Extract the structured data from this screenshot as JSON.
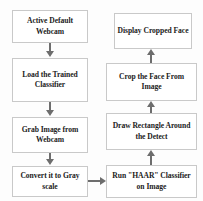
{
  "diagram": {
    "type": "flowchart",
    "orientation": "two-column-serpentine",
    "colors": {
      "box_fill": "#ffffff",
      "box_border": "#c9c9c9",
      "text": "#1b1b1b",
      "connector": "#6d6d6d",
      "background": "#fdfdfd"
    },
    "nodes": [
      {
        "id": "active-webcam",
        "label": "Active Default Webcam",
        "column": "left",
        "order": 1
      },
      {
        "id": "load-classifier",
        "label": "Load the Trained Classifier",
        "column": "left",
        "order": 2
      },
      {
        "id": "grab-image",
        "label": "Grab Image from Webcam",
        "column": "left",
        "order": 3
      },
      {
        "id": "convert-gray",
        "label": "Convert it to Gray scale",
        "column": "left",
        "order": 4
      },
      {
        "id": "run-haar",
        "label": "Run \"HAAR\" Classifier on Image",
        "column": "right",
        "order": 5
      },
      {
        "id": "draw-rect",
        "label": "Draw Rectangle Around the Detect",
        "column": "right",
        "order": 6
      },
      {
        "id": "crop-face",
        "label": "Crop the Face From Image",
        "column": "right",
        "order": 7
      },
      {
        "id": "display-face",
        "label": "Display Cropped Face",
        "column": "right",
        "order": 8
      }
    ],
    "connectors": [
      {
        "id": "c1",
        "from": "active-webcam",
        "to": "load-classifier",
        "direction": "down"
      },
      {
        "id": "c2",
        "from": "load-classifier",
        "to": "grab-image",
        "direction": "down"
      },
      {
        "id": "c3",
        "from": "grab-image",
        "to": "convert-gray",
        "direction": "down"
      },
      {
        "id": "c4",
        "from": "convert-gray",
        "to": "run-haar",
        "direction": "right"
      },
      {
        "id": "c5",
        "from": "run-haar",
        "to": "draw-rect",
        "direction": "up"
      },
      {
        "id": "c6",
        "from": "draw-rect",
        "to": "crop-face",
        "direction": "up"
      },
      {
        "id": "c7",
        "from": "crop-face",
        "to": "display-face",
        "direction": "up"
      }
    ]
  }
}
